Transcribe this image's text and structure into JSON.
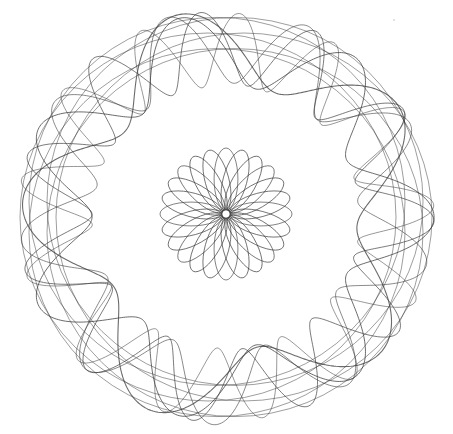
{
  "image": {
    "subject": "spirograph drawing",
    "background": "#ffffff",
    "stroke_color": "#3a3a3a",
    "outer_pattern": {
      "center": [
        226,
        217
      ],
      "outer_radius": 210,
      "inner_radius": 132,
      "description": "wide ring of overlapping wavy loops"
    },
    "inner_rose": {
      "center": [
        226,
        214
      ],
      "radius": 66,
      "hole_radius": 4,
      "petals": 24
    }
  }
}
